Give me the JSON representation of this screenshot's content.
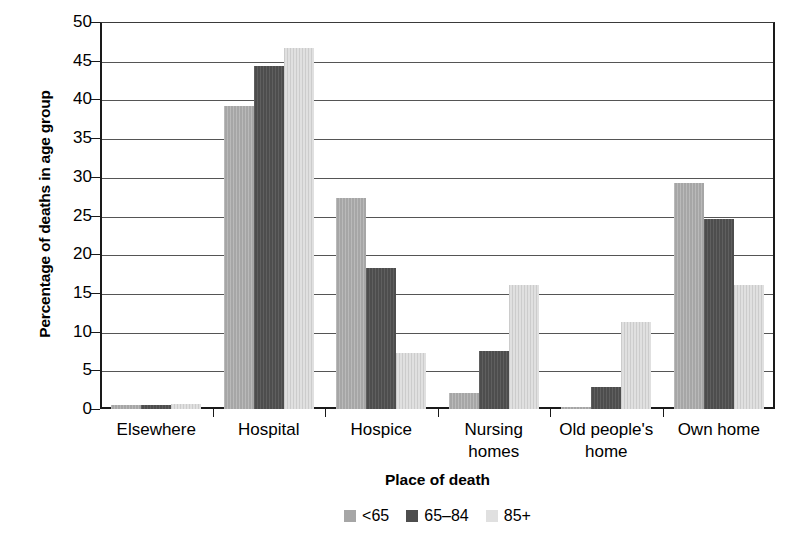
{
  "chart_data": {
    "type": "bar",
    "title": "",
    "xlabel": "Place of death",
    "ylabel": "Percentage of deaths in age group",
    "ylim": [
      0,
      50
    ],
    "yticks": [
      0,
      5,
      10,
      15,
      20,
      25,
      30,
      35,
      40,
      45,
      50
    ],
    "grid": true,
    "legend_position": "bottom",
    "categories": [
      "Elsewhere",
      "Hospital",
      "Hospice",
      "Nursing homes",
      "Old people's home",
      "Own home"
    ],
    "category_lines": [
      [
        "Elsewhere"
      ],
      [
        "Hospital"
      ],
      [
        "Hospice"
      ],
      [
        "Nursing",
        "homes"
      ],
      [
        "Old people's",
        "home"
      ],
      [
        "Own home"
      ]
    ],
    "series": [
      {
        "name": "<65",
        "color": "#a6a6a6",
        "values": [
          0.5,
          39.2,
          27.2,
          2.1,
          0.2,
          29.2
        ]
      },
      {
        "name": "65–84",
        "color": "#4d4d4d",
        "values": [
          0.5,
          44.3,
          18.2,
          7.5,
          2.9,
          24.5
        ]
      },
      {
        "name": "85+",
        "color": "#e0e0e0",
        "values": [
          0.7,
          46.6,
          7.3,
          16.0,
          11.2,
          16.0
        ]
      }
    ]
  }
}
